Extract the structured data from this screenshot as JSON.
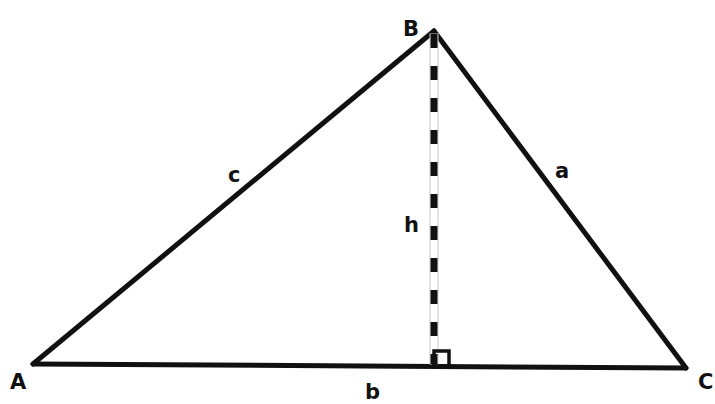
{
  "diagram": {
    "vertices": {
      "A": {
        "label": "A",
        "x": 33,
        "y": 364,
        "label_x": 17,
        "label_y": 389
      },
      "B": {
        "label": "B",
        "x": 434,
        "y": 31,
        "label_x": 411,
        "label_y": 36
      },
      "C": {
        "label": "C",
        "x": 686,
        "y": 368,
        "label_x": 706,
        "label_y": 389
      }
    },
    "sides": {
      "a": {
        "label": "a",
        "from": "B",
        "to": "C",
        "label_x": 562,
        "label_y": 178
      },
      "b": {
        "label": "b",
        "from": "A",
        "to": "C",
        "label_x": 372,
        "label_y": 399
      },
      "c": {
        "label": "c",
        "from": "A",
        "to": "B",
        "label_x": 235,
        "label_y": 182
      }
    },
    "altitude": {
      "label": "h",
      "from": "B",
      "foot_x": 434,
      "foot_y": 366,
      "label_x": 411,
      "label_y": 232,
      "style": "dashed"
    },
    "right_angle_marker": {
      "x": 434,
      "y": 351,
      "size": 15
    },
    "colors": {
      "stroke": "#111111",
      "background": "#ffffff",
      "dash_outline": "#bbbbbb"
    }
  }
}
